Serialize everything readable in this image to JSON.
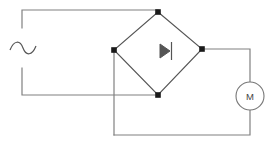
{
  "diagram": {
    "type": "schematic",
    "canvas": {
      "width": 276,
      "height": 144,
      "background": "#ffffff"
    },
    "colors": {
      "wire": "#808080",
      "bridge_edge": "#555555",
      "node": "#1a1a1a",
      "symbol": "#555555",
      "component_outline": "#777777",
      "label_text": "#444444"
    },
    "components": [
      {
        "id": "ac-source",
        "name": "ac-source-symbol",
        "label": "~",
        "symbol": "sine-wave",
        "position": {
          "x": 22,
          "y": 48
        },
        "description": "AC voltage source shown as a tilde / sine wave breaking the left vertical wire"
      },
      {
        "id": "bridge-rectifier",
        "name": "bridge-rectifier-diamond",
        "symbol": "diamond-bridge",
        "nodes": {
          "top": {
            "x": 158,
            "y": 12
          },
          "left": {
            "x": 114,
            "y": 50
          },
          "right": {
            "x": 202,
            "y": 49
          },
          "bottom": {
            "x": 158,
            "y": 95
          }
        },
        "description": "Diamond-shaped bridge rectifier block with four junction nodes"
      },
      {
        "id": "diode",
        "name": "diode-symbol",
        "symbol": "diode-right",
        "orientation": "right",
        "position": {
          "x": 166,
          "y": 51
        },
        "description": "Diode triangle pointing right with cathode bar, centered inside the bridge diamond"
      },
      {
        "id": "motor",
        "name": "motor-symbol",
        "label": "M",
        "symbol": "circle-with-letter",
        "position": {
          "x": 250,
          "y": 96
        },
        "radius": 14,
        "description": "DC motor drawn as a circle containing the letter M on the right branch"
      }
    ],
    "junction_nodes": [
      {
        "name": "node-bridge-top",
        "x": 158,
        "y": 12
      },
      {
        "name": "node-bridge-left",
        "x": 114,
        "y": 50
      },
      {
        "name": "node-bridge-right",
        "x": 202,
        "y": 49
      },
      {
        "name": "node-bridge-bottom",
        "x": 158,
        "y": 95
      }
    ],
    "wires": [
      {
        "name": "wire-ac-top-to-bridge-top",
        "path": "M22,28 L22,10 L158,10 L158,12",
        "description": "From top of AC source up and across to the bridge top node"
      },
      {
        "name": "wire-ac-bottom-to-bridge-bottom",
        "path": "M22,68 L22,95 L158,95",
        "description": "From bottom of AC source down and across to the bridge bottom node, crossing the left branch without connecting"
      },
      {
        "name": "wire-bridge-right-to-motor",
        "path": "M202,49 L250,49 L250,82",
        "description": "From bridge right node across to the top of the motor"
      },
      {
        "name": "wire-motor-to-bottom-rail",
        "path": "M250,110 L250,135 L114,135",
        "description": "From bottom of the motor down to the bottom rail and left"
      },
      {
        "name": "wire-bridge-left-to-bottom-rail",
        "path": "M114,50 L114,135",
        "description": "From bridge left node straight down to the bottom rail"
      }
    ],
    "crossings": [
      {
        "name": "wire-crossing-no-connection",
        "x": 114,
        "y": 95,
        "description": "The AC return wire crosses the bridge-left vertical branch without a junction dot"
      }
    ]
  }
}
